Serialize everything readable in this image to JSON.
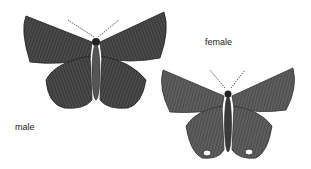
{
  "labels": {
    "male": "male",
    "female": "female"
  },
  "figures": [
    {
      "name": "male-butterfly",
      "sex": "male"
    },
    {
      "name": "female-butterfly",
      "sex": "female"
    }
  ]
}
